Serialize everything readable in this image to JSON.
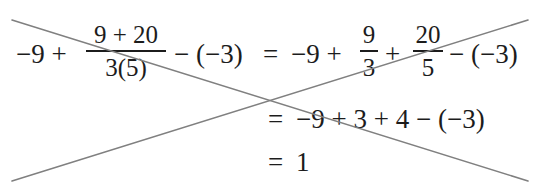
{
  "worked_example": {
    "row1": {
      "term1": "−9 +",
      "fraction1": {
        "numerator": "9 + 20",
        "denominator": "3(5)"
      },
      "term2": "− (−3)",
      "equals": "=",
      "rhs_term1": "−9 +",
      "fraction2": {
        "numerator": "9",
        "denominator": "3"
      },
      "plus": "+",
      "fraction3": {
        "numerator": "20",
        "denominator": "5"
      },
      "rhs_term2": "− (−3)"
    },
    "row2": {
      "equals": "=",
      "expression": "−9 + 3 + 4 − (−3)"
    },
    "row3": {
      "equals": "=",
      "result": "1"
    }
  },
  "cross_out": {
    "color": "#808080",
    "line1": {
      "x1": 12,
      "y1": 20,
      "x2": 528,
      "y2": 181
    },
    "line2": {
      "x1": 12,
      "y1": 181,
      "x2": 528,
      "y2": 20
    }
  }
}
